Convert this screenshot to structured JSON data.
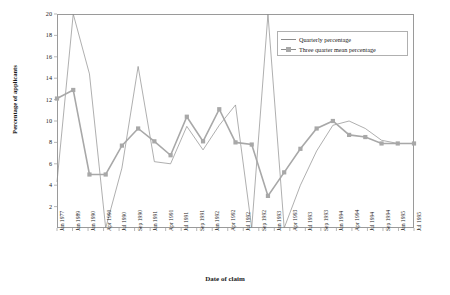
{
  "chart_data": {
    "type": "line",
    "title": "",
    "xlabel": "Date of claim",
    "ylabel": "Percentage of applicants",
    "ylim": [
      0,
      20
    ],
    "yticks": [
      2,
      4,
      6,
      8,
      10,
      12,
      14,
      16,
      18,
      20
    ],
    "grid": false,
    "legend_position": "top-right",
    "categories": [
      "Jan 1989",
      "Jan 1990",
      "Apr 1990",
      "Jul 1990",
      "Sep 1990",
      "Jan 1991",
      "Apr 1991",
      "Jul 1991",
      "Sep 1991",
      "Jan 1992",
      "Apr 1992",
      "Jul 1992",
      "Sep 1992",
      "Jan 1993",
      "Apr 1993",
      "Jul 1993",
      "Sep 1993",
      "Jan 1994",
      "Apr 1994",
      "Jul 1994",
      "Sep 1994",
      "Jan 1995",
      "Jul 1995"
    ],
    "x_tick_labels": [
      "Jan 1977",
      "Jan 1989",
      "Jan 1990",
      "Apr 1990",
      "Jul 1990",
      "Sep 1990",
      "Jan 1991",
      "Apr 1991",
      "Jul 1991",
      "Sep 1991",
      "Jan 1992",
      "Apr 1992",
      "Jul 1992",
      "Sep 1992",
      "Jan 1993",
      "Apr 1993",
      "Jul 1993",
      "Sep 1993",
      "Jan 1994",
      "Apr 1994",
      "Jul 1994",
      "Sep 1994",
      "Jan 1995",
      "Jul 1995"
    ],
    "series": [
      {
        "name": "Quarterly percentage",
        "marker": "none",
        "color": "#8c8c8c",
        "values": [
          4.3,
          20.0,
          14.4,
          0.0,
          5.6,
          15.1,
          6.2,
          6.0,
          9.5,
          7.3,
          9.6,
          11.5,
          0.0,
          20.0,
          0.0,
          4.0,
          7.2,
          9.6,
          10.0,
          9.3,
          8.2,
          7.9,
          7.9
        ]
      },
      {
        "name": "Three quarter mean percentage",
        "marker": "square",
        "color": "#a8a8a8",
        "values": [
          12.1,
          12.9,
          5.0,
          5.0,
          7.7,
          9.3,
          8.1,
          6.8,
          10.4,
          8.1,
          11.1,
          8.0,
          7.8,
          3.0,
          5.2,
          7.4,
          9.3,
          10.0,
          8.7,
          8.5,
          7.9,
          7.9,
          7.9
        ]
      }
    ]
  }
}
